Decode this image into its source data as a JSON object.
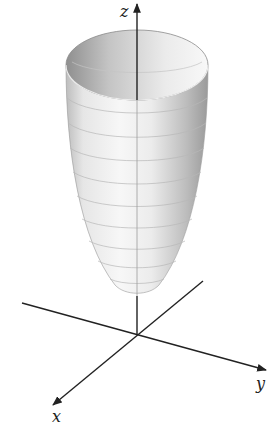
{
  "figure": {
    "surface": "paraboloid",
    "axes": {
      "z_label": "z",
      "x_label": "x",
      "y_label": "y"
    },
    "colors": {
      "axis": "#222222",
      "surface_light": "#f4f4f4",
      "surface_dark": "#9a9a9a",
      "grid_lines": "#b8b8b8",
      "background": "#ffffff"
    },
    "level_curves_count": 9
  }
}
